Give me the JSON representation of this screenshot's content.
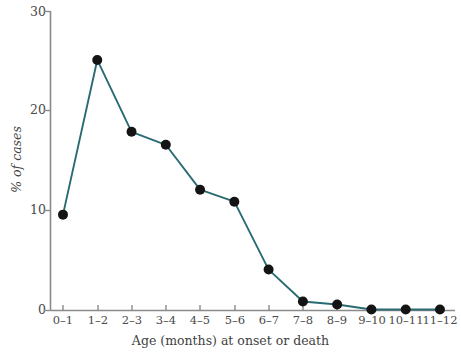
{
  "chart_data": {
    "type": "line",
    "title": "",
    "subtitle": "",
    "xlabel": "Age (months) at onset or death",
    "ylabel": "% of cases",
    "categories": [
      "0–1",
      "1–2",
      "2–3",
      "3–4",
      "4–5",
      "5–6",
      "6–7",
      "7–8",
      "8–9",
      "9–10",
      "10–11",
      "11–12"
    ],
    "values": [
      9.6,
      25.1,
      17.9,
      16.6,
      12.1,
      10.9,
      4.1,
      0.9,
      0.6,
      0.1,
      0.1,
      0.1
    ],
    "ylim": [
      0,
      30
    ],
    "yticks": [
      0,
      10,
      20,
      30
    ],
    "ytick_labels": [
      "0",
      "10",
      "20",
      "30"
    ],
    "grid": false,
    "legend": "none",
    "series_color": "#2a6b72",
    "marker_color": "#141414",
    "axis_color": "#8a8a8a",
    "marker": "circle",
    "marker_size": 5
  },
  "axes": {
    "y_title": "% of cases",
    "x_title": "Age (months) at onset or death"
  }
}
